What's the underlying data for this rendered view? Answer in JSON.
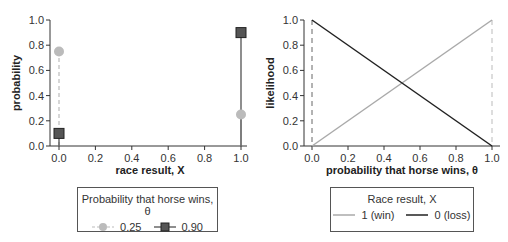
{
  "chart_data": [
    {
      "type": "scatter",
      "title": "",
      "xlabel": "race result, X",
      "ylabel": "probability",
      "xlim": [
        0.0,
        1.0
      ],
      "ylim": [
        0.0,
        1.0
      ],
      "xticks": [
        "0.0",
        "0.2",
        "0.4",
        "0.6",
        "0.8",
        "1.0"
      ],
      "yticks": [
        "0.0",
        "0.2",
        "0.4",
        "0.6",
        "0.8",
        "1.0"
      ],
      "grid": false,
      "legend": {
        "title": "Probability that horse wins, θ",
        "position": "below",
        "entries": [
          "0.25",
          "0.90"
        ]
      },
      "series": [
        {
          "name": "0.25",
          "marker": "circle",
          "line": "dashed",
          "color": "#bbbbbb",
          "x": [
            0,
            1
          ],
          "y": [
            0.75,
            0.25
          ]
        },
        {
          "name": "0.90",
          "marker": "square",
          "line": "solid",
          "color": "#444444",
          "x": [
            0,
            1
          ],
          "y": [
            0.1,
            0.9
          ]
        }
      ]
    },
    {
      "type": "line",
      "title": "",
      "xlabel": "probability that horse wins, θ",
      "ylabel": "likelihood",
      "xlim": [
        0.0,
        1.0
      ],
      "ylim": [
        0.0,
        1.0
      ],
      "xticks": [
        "0.0",
        "0.2",
        "0.4",
        "0.6",
        "0.8",
        "1.0"
      ],
      "yticks": [
        "0.0",
        "0.2",
        "0.4",
        "0.6",
        "0.8",
        "1.0"
      ],
      "grid": false,
      "vlines": [
        0.0,
        1.0
      ],
      "legend": {
        "title": "Race result, X",
        "position": "below",
        "entries": [
          "1 (win)",
          "0 (loss)"
        ]
      },
      "series": [
        {
          "name": "1 (win)",
          "color": "#aaaaaa",
          "x": [
            0,
            1
          ],
          "y": [
            0,
            1
          ]
        },
        {
          "name": "0 (loss)",
          "color": "#222222",
          "x": [
            0,
            1
          ],
          "y": [
            1,
            0
          ]
        }
      ]
    }
  ],
  "left": {
    "ylabel": "probability",
    "xlabel": "race result, X",
    "ticks": [
      "0.0",
      "0.2",
      "0.4",
      "0.6",
      "0.8",
      "1.0"
    ],
    "legend_title": "Probability that horse wins, θ",
    "legend_items": [
      "0.25",
      "0.90"
    ]
  },
  "right": {
    "ylabel": "likelihood",
    "xlabel": "probability that horse wins, θ",
    "ticks": [
      "0.0",
      "0.2",
      "0.4",
      "0.6",
      "0.8",
      "1.0"
    ],
    "legend_title": "Race result, X",
    "legend_items": [
      "1 (win)",
      "0 (loss)"
    ]
  }
}
